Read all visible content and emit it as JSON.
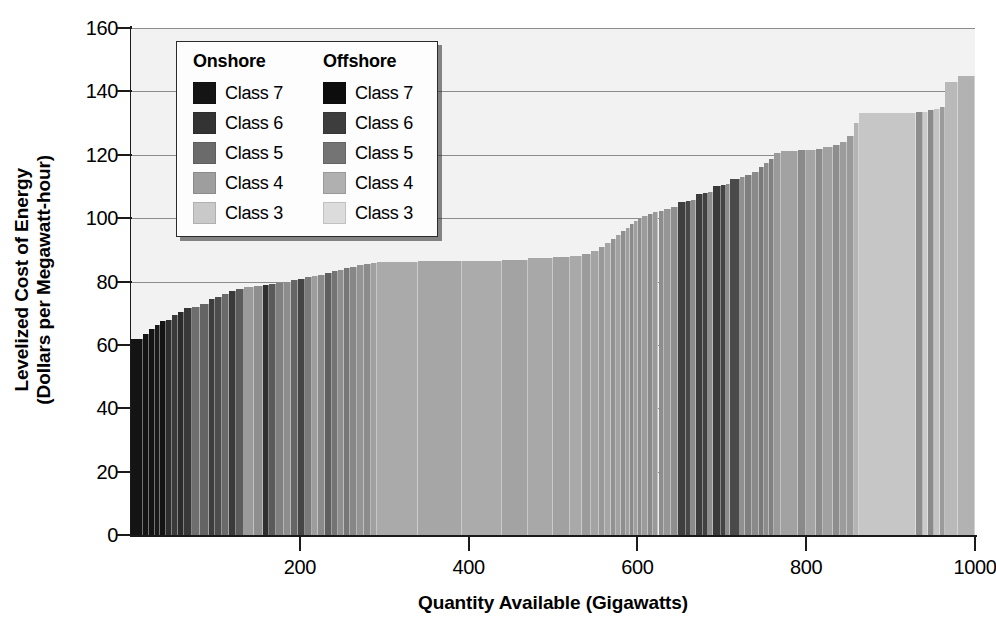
{
  "chart_data": {
    "type": "bar",
    "title": "",
    "xlabel": "Quantity Available (Gigawatts)",
    "ylabel": "Levelized Cost of Energy (Dollars per Megawatt-hour)",
    "ylabel_lines": [
      "Levelized Cost of Energy",
      "(Dollars per Megawatt-hour)"
    ],
    "xlim": [
      0,
      1000
    ],
    "ylim": [
      0,
      160
    ],
    "xticks": [
      200,
      400,
      600,
      800,
      1000
    ],
    "yticks": [
      0,
      20,
      40,
      60,
      80,
      100,
      120,
      140,
      160
    ],
    "grid": "horizontal",
    "legend_position": "upper-left-inside",
    "plot_background": "#f2f2f2",
    "gridline_color": "#8c8c8c",
    "axis_color": "#1a1a1a",
    "class_colors": {
      "onshore_class7": "#141414",
      "onshore_class6": "#333333",
      "onshore_class5": "#6b6b6b",
      "onshore_class4": "#9e9e9e",
      "onshore_class3": "#c9c9c9",
      "offshore_class7": "#0d0d0d",
      "offshore_class6": "#3d3d3d",
      "offshore_class5": "#747474",
      "offshore_class4": "#b0b0b0",
      "offshore_class3": "#dcdcdc"
    },
    "segments": [
      {
        "x0": 0,
        "x1": 14,
        "y": 62.0,
        "c": "#141414"
      },
      {
        "x0": 14,
        "x1": 21,
        "y": 63.5,
        "c": "#141414"
      },
      {
        "x0": 21,
        "x1": 28,
        "y": 65.0,
        "c": "#141414"
      },
      {
        "x0": 28,
        "x1": 34,
        "y": 66.3,
        "c": "#1a1a1a"
      },
      {
        "x0": 34,
        "x1": 41,
        "y": 67.5,
        "c": "#141414"
      },
      {
        "x0": 41,
        "x1": 48,
        "y": 68.0,
        "c": "#2e2e2e"
      },
      {
        "x0": 48,
        "x1": 56,
        "y": 69.5,
        "c": "#3a3a3a"
      },
      {
        "x0": 56,
        "x1": 63,
        "y": 70.5,
        "c": "#2b2b2b"
      },
      {
        "x0": 63,
        "x1": 72,
        "y": 71.5,
        "c": "#383838"
      },
      {
        "x0": 72,
        "x1": 82,
        "y": 72.0,
        "c": "#6e6e6e"
      },
      {
        "x0": 82,
        "x1": 92,
        "y": 73.0,
        "c": "#646464"
      },
      {
        "x0": 92,
        "x1": 100,
        "y": 74.5,
        "c": "#3d3d3d"
      },
      {
        "x0": 100,
        "x1": 108,
        "y": 75.2,
        "c": "#4d4d4d"
      },
      {
        "x0": 108,
        "x1": 116,
        "y": 76.0,
        "c": "#6a6a6a"
      },
      {
        "x0": 116,
        "x1": 124,
        "y": 77.0,
        "c": "#3a3a3a"
      },
      {
        "x0": 124,
        "x1": 134,
        "y": 77.6,
        "c": "#5c5c5c"
      },
      {
        "x0": 134,
        "x1": 146,
        "y": 78.2,
        "c": "#9a9a9a"
      },
      {
        "x0": 146,
        "x1": 156,
        "y": 78.6,
        "c": "#8e8e8e"
      },
      {
        "x0": 156,
        "x1": 163,
        "y": 78.9,
        "c": "#2f2f2f"
      },
      {
        "x0": 163,
        "x1": 172,
        "y": 79.2,
        "c": "#5a5a5a"
      },
      {
        "x0": 172,
        "x1": 181,
        "y": 79.6,
        "c": "#808080"
      },
      {
        "x0": 181,
        "x1": 190,
        "y": 80.0,
        "c": "#8d8d8d"
      },
      {
        "x0": 190,
        "x1": 198,
        "y": 80.4,
        "c": "#666666"
      },
      {
        "x0": 198,
        "x1": 206,
        "y": 80.8,
        "c": "#454545"
      },
      {
        "x0": 206,
        "x1": 214,
        "y": 81.3,
        "c": "#7a7a7a"
      },
      {
        "x0": 214,
        "x1": 222,
        "y": 81.8,
        "c": "#9d9d9d"
      },
      {
        "x0": 222,
        "x1": 230,
        "y": 82.2,
        "c": "#8a8a8a"
      },
      {
        "x0": 230,
        "x1": 238,
        "y": 82.7,
        "c": "#5f5f5f"
      },
      {
        "x0": 238,
        "x1": 245,
        "y": 83.2,
        "c": "#747474"
      },
      {
        "x0": 245,
        "x1": 252,
        "y": 83.7,
        "c": "#8f8f8f"
      },
      {
        "x0": 252,
        "x1": 260,
        "y": 84.2,
        "c": "#777777"
      },
      {
        "x0": 260,
        "x1": 268,
        "y": 84.7,
        "c": "#878787"
      },
      {
        "x0": 268,
        "x1": 276,
        "y": 85.1,
        "c": "#949494"
      },
      {
        "x0": 276,
        "x1": 284,
        "y": 85.5,
        "c": "#8b8b8b"
      },
      {
        "x0": 284,
        "x1": 292,
        "y": 85.9,
        "c": "#a0a0a0"
      },
      {
        "x0": 292,
        "x1": 340,
        "y": 86.2,
        "c": "#aaaaaa"
      },
      {
        "x0": 340,
        "x1": 392,
        "y": 86.4,
        "c": "#a6a6a6"
      },
      {
        "x0": 392,
        "x1": 440,
        "y": 86.6,
        "c": "#ababab"
      },
      {
        "x0": 440,
        "x1": 470,
        "y": 86.9,
        "c": "#a3a3a3"
      },
      {
        "x0": 470,
        "x1": 500,
        "y": 87.4,
        "c": "#a8a8a8"
      },
      {
        "x0": 500,
        "x1": 520,
        "y": 87.8,
        "c": "#a1a1a1"
      },
      {
        "x0": 520,
        "x1": 534,
        "y": 88.2,
        "c": "#a9a9a9"
      },
      {
        "x0": 534,
        "x1": 545,
        "y": 88.6,
        "c": "#9b9b9b"
      },
      {
        "x0": 545,
        "x1": 554,
        "y": 89.6,
        "c": "#a4a4a4"
      },
      {
        "x0": 554,
        "x1": 562,
        "y": 90.8,
        "c": "#999999"
      },
      {
        "x0": 562,
        "x1": 569,
        "y": 92.0,
        "c": "#a5a5a5"
      },
      {
        "x0": 569,
        "x1": 575,
        "y": 93.3,
        "c": "#929292"
      },
      {
        "x0": 575,
        "x1": 581,
        "y": 94.6,
        "c": "#a2a2a2"
      },
      {
        "x0": 581,
        "x1": 586,
        "y": 95.8,
        "c": "#8f8f8f"
      },
      {
        "x0": 586,
        "x1": 591,
        "y": 97.0,
        "c": "#9f9f9f"
      },
      {
        "x0": 591,
        "x1": 596,
        "y": 98.2,
        "c": "#8b8b8b"
      },
      {
        "x0": 596,
        "x1": 601,
        "y": 99.2,
        "c": "#a0a0a0"
      },
      {
        "x0": 601,
        "x1": 606,
        "y": 100.0,
        "c": "#8e8e8e"
      },
      {
        "x0": 606,
        "x1": 612,
        "y": 100.6,
        "c": "#9c9c9c"
      },
      {
        "x0": 612,
        "x1": 618,
        "y": 101.2,
        "c": "#8a8a8a"
      },
      {
        "x0": 618,
        "x1": 625,
        "y": 101.8,
        "c": "#9a9a9a"
      },
      {
        "x0": 625,
        "x1": 632,
        "y": 102.4,
        "c": "#8d8d8d"
      },
      {
        "x0": 632,
        "x1": 640,
        "y": 103.0,
        "c": "#969696"
      },
      {
        "x0": 640,
        "x1": 648,
        "y": 103.6,
        "c": "#8f8f8f"
      },
      {
        "x0": 648,
        "x1": 657,
        "y": 105.0,
        "c": "#3f3f3f"
      },
      {
        "x0": 657,
        "x1": 664,
        "y": 105.4,
        "c": "#474747"
      },
      {
        "x0": 664,
        "x1": 669,
        "y": 105.8,
        "c": "#8b8b8b"
      },
      {
        "x0": 669,
        "x1": 678,
        "y": 107.6,
        "c": "#3c3c3c"
      },
      {
        "x0": 678,
        "x1": 684,
        "y": 108.0,
        "c": "#414141"
      },
      {
        "x0": 684,
        "x1": 689,
        "y": 108.4,
        "c": "#8e8e8e"
      },
      {
        "x0": 689,
        "x1": 699,
        "y": 110.0,
        "c": "#3a3a3a"
      },
      {
        "x0": 699,
        "x1": 705,
        "y": 110.4,
        "c": "#444444"
      },
      {
        "x0": 705,
        "x1": 710,
        "y": 110.8,
        "c": "#8c8c8c"
      },
      {
        "x0": 710,
        "x1": 722,
        "y": 112.4,
        "c": "#4a4a4a"
      },
      {
        "x0": 722,
        "x1": 728,
        "y": 113.0,
        "c": "#909090"
      },
      {
        "x0": 728,
        "x1": 736,
        "y": 113.6,
        "c": "#7f7f7f"
      },
      {
        "x0": 736,
        "x1": 744,
        "y": 114.6,
        "c": "#8a8a8a"
      },
      {
        "x0": 744,
        "x1": 750,
        "y": 116.0,
        "c": "#7a7a7a"
      },
      {
        "x0": 750,
        "x1": 756,
        "y": 117.4,
        "c": "#8d8d8d"
      },
      {
        "x0": 756,
        "x1": 762,
        "y": 118.8,
        "c": "#818181"
      },
      {
        "x0": 762,
        "x1": 770,
        "y": 120.6,
        "c": "#9a9a9a"
      },
      {
        "x0": 770,
        "x1": 790,
        "y": 121.2,
        "c": "#a2a2a2"
      },
      {
        "x0": 790,
        "x1": 800,
        "y": 121.4,
        "c": "#8a8a8a"
      },
      {
        "x0": 800,
        "x1": 812,
        "y": 121.6,
        "c": "#a4a4a4"
      },
      {
        "x0": 812,
        "x1": 820,
        "y": 121.8,
        "c": "#8c8c8c"
      },
      {
        "x0": 820,
        "x1": 832,
        "y": 122.4,
        "c": "#a1a1a1"
      },
      {
        "x0": 832,
        "x1": 840,
        "y": 123.0,
        "c": "#8e8e8e"
      },
      {
        "x0": 840,
        "x1": 848,
        "y": 124.0,
        "c": "#9c9c9c"
      },
      {
        "x0": 848,
        "x1": 857,
        "y": 126.0,
        "c": "#9a9a9a"
      },
      {
        "x0": 857,
        "x1": 862,
        "y": 130.0,
        "c": "#b4b4b4"
      },
      {
        "x0": 862,
        "x1": 930,
        "y": 133.2,
        "c": "#c6c6c6"
      },
      {
        "x0": 930,
        "x1": 938,
        "y": 133.5,
        "c": "#8d8d8d"
      },
      {
        "x0": 938,
        "x1": 944,
        "y": 133.6,
        "c": "#cacaca"
      },
      {
        "x0": 944,
        "x1": 952,
        "y": 134.0,
        "c": "#8a8a8a"
      },
      {
        "x0": 952,
        "x1": 958,
        "y": 134.4,
        "c": "#c4c4c4"
      },
      {
        "x0": 958,
        "x1": 965,
        "y": 135.0,
        "c": "#9b9b9b"
      },
      {
        "x0": 965,
        "x1": 980,
        "y": 143.0,
        "c": "#b9b9b9"
      },
      {
        "x0": 980,
        "x1": 1000,
        "y": 145.0,
        "c": "#b2b2b2"
      }
    ]
  },
  "axes": {
    "ylabel_lines": [
      "Levelized Cost of Energy",
      "(Dollars per Megawatt-hour)"
    ],
    "xlabel": "Quantity Available (Gigawatts)",
    "yticks": [
      "0",
      "20",
      "40",
      "60",
      "80",
      "100",
      "120",
      "140",
      "160"
    ],
    "xticks": [
      "200",
      "400",
      "600",
      "800",
      "1000"
    ]
  },
  "legend": {
    "columns": [
      {
        "title": "Onshore",
        "items": [
          {
            "label": "Class 7",
            "color": "#141414"
          },
          {
            "label": "Class 6",
            "color": "#333333"
          },
          {
            "label": "Class 5",
            "color": "#6b6b6b"
          },
          {
            "label": "Class 4",
            "color": "#9e9e9e"
          },
          {
            "label": "Class 3",
            "color": "#c9c9c9"
          }
        ]
      },
      {
        "title": "Offshore",
        "items": [
          {
            "label": "Class 7",
            "color": "#0d0d0d"
          },
          {
            "label": "Class 6",
            "color": "#3d3d3d"
          },
          {
            "label": "Class 5",
            "color": "#747474"
          },
          {
            "label": "Class 4",
            "color": "#b0b0b0"
          },
          {
            "label": "Class 3",
            "color": "#dcdcdc"
          }
        ]
      }
    ]
  }
}
